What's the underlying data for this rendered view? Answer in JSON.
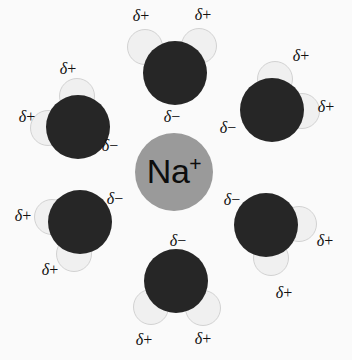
{
  "figure": {
    "background_color": "#fafafa",
    "width": 352,
    "height": 360
  },
  "ion": {
    "name": "sodium-ion",
    "symbol": "Na",
    "charge": "+",
    "color": "#9a9a9a",
    "cx": 174,
    "cy": 172,
    "r": 39
  },
  "atom_colors": {
    "oxygen": "#262626",
    "hydrogen": "#f0f0f0",
    "hydrogen_outline": "#d2d2d2",
    "text": "#111111"
  },
  "labels": {
    "delta_plus": "δ+",
    "delta_minus": "δ−",
    "delta": "δ",
    "plus": "+",
    "minus": "−"
  },
  "molecules": [
    {
      "name": "water-top",
      "oxygen": {
        "cx": 175,
        "cy": 73,
        "r": 32
      },
      "hydrogens": [
        {
          "cx": 145,
          "cy": 47,
          "r": 18
        },
        {
          "cx": 199,
          "cy": 46,
          "r": 18
        }
      ],
      "charge_labels": [
        {
          "text": "δ+",
          "x": 141,
          "y": 16
        },
        {
          "text": "δ+",
          "x": 203,
          "y": 15
        },
        {
          "text": "δ−",
          "x": 172,
          "y": 117
        }
      ]
    },
    {
      "name": "water-upper-left",
      "oxygen": {
        "cx": 78,
        "cy": 127,
        "r": 32
      },
      "hydrogens": [
        {
          "cx": 77,
          "cy": 96,
          "r": 18
        },
        {
          "cx": 48,
          "cy": 128,
          "r": 18
        }
      ],
      "charge_labels": [
        {
          "text": "δ+",
          "x": 68,
          "y": 69
        },
        {
          "text": "δ+",
          "x": 27,
          "y": 117
        },
        {
          "text": "δ−",
          "x": 110,
          "y": 146
        }
      ]
    },
    {
      "name": "water-upper-right",
      "oxygen": {
        "cx": 272,
        "cy": 110,
        "r": 32
      },
      "hydrogens": [
        {
          "cx": 275,
          "cy": 79,
          "r": 18
        },
        {
          "cx": 302,
          "cy": 111,
          "r": 18
        }
      ],
      "charge_labels": [
        {
          "text": "δ+",
          "x": 301,
          "y": 56
        },
        {
          "text": "δ+",
          "x": 326,
          "y": 107
        },
        {
          "text": "δ−",
          "x": 228,
          "y": 128
        }
      ]
    },
    {
      "name": "water-lower-left",
      "oxygen": {
        "cx": 80,
        "cy": 222,
        "r": 32
      },
      "hydrogens": [
        {
          "cx": 52,
          "cy": 217,
          "r": 18
        },
        {
          "cx": 74,
          "cy": 254,
          "r": 18
        }
      ],
      "charge_labels": [
        {
          "text": "δ+",
          "x": 23,
          "y": 216
        },
        {
          "text": "δ+",
          "x": 50,
          "y": 270
        },
        {
          "text": "δ−",
          "x": 115,
          "y": 199
        }
      ]
    },
    {
      "name": "water-lower-right",
      "oxygen": {
        "cx": 266,
        "cy": 225,
        "r": 32
      },
      "hydrogens": [
        {
          "cx": 299,
          "cy": 224,
          "r": 18
        },
        {
          "cx": 271,
          "cy": 258,
          "r": 18
        }
      ],
      "charge_labels": [
        {
          "text": "δ+",
          "x": 325,
          "y": 241
        },
        {
          "text": "δ+",
          "x": 284,
          "y": 293
        },
        {
          "text": "δ−",
          "x": 232,
          "y": 200
        }
      ]
    },
    {
      "name": "water-bottom",
      "oxygen": {
        "cx": 176,
        "cy": 281,
        "r": 32
      },
      "hydrogens": [
        {
          "cx": 151,
          "cy": 307,
          "r": 18
        },
        {
          "cx": 203,
          "cy": 308,
          "r": 18
        }
      ],
      "charge_labels": [
        {
          "text": "δ−",
          "x": 178,
          "y": 241
        },
        {
          "text": "δ+",
          "x": 144,
          "y": 340
        },
        {
          "text": "δ+",
          "x": 203,
          "y": 339
        }
      ]
    }
  ]
}
